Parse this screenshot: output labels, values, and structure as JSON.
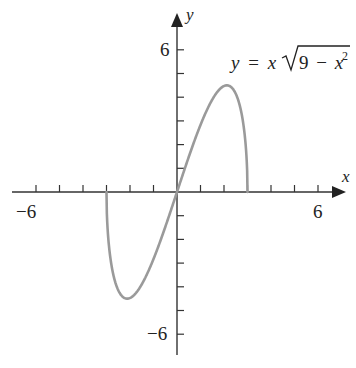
{
  "chart_data": {
    "type": "line",
    "title": "",
    "equation": "y = x√(9 − x²)",
    "equation_parts": {
      "lhs": "y",
      "eq": "=",
      "x": "x",
      "radicand_const": "9",
      "minus": "−",
      "radicand_var": "x",
      "exponent": "2"
    },
    "xlabel": "x",
    "ylabel": "y",
    "xlim": [
      -7,
      7
    ],
    "ylim": [
      -7,
      7
    ],
    "x_tick_labels": [
      "-6",
      "6"
    ],
    "y_tick_labels": [
      "6",
      "-6"
    ],
    "x_ticks": [
      -6,
      -5,
      -4,
      -3,
      -2,
      -1,
      1,
      2,
      3,
      4,
      5,
      6
    ],
    "y_ticks": [
      -6,
      -5,
      -4,
      -3,
      -2,
      -1,
      1,
      2,
      3,
      4,
      5,
      6
    ],
    "grid": false,
    "series": [
      {
        "name": "y = x√(9 − x²)",
        "domain": [
          -3,
          3
        ],
        "x": [
          -3,
          -2.9,
          -2.7,
          -2.5,
          -2.12,
          -1.5,
          -1,
          -0.5,
          0,
          0.5,
          1,
          1.5,
          2.12,
          2.5,
          2.7,
          2.9,
          3
        ],
        "y": [
          0,
          -2.22,
          -3.53,
          -4.15,
          -4.5,
          -3.9,
          -2.83,
          -1.48,
          0,
          1.48,
          2.83,
          3.9,
          4.5,
          4.15,
          3.53,
          2.22,
          0
        ]
      }
    ],
    "annotations": [
      {
        "text": "y = x√(9 − x²)",
        "position": "upper right"
      }
    ],
    "colors": {
      "curve": "#9a9a9a",
      "axes": "#333333",
      "text": "#222222"
    }
  },
  "labels": {
    "x_axis": "x",
    "y_axis": "y",
    "x_neg6": "−6",
    "x_pos6": "6",
    "y_pos6": "6",
    "y_neg6": "−6"
  }
}
